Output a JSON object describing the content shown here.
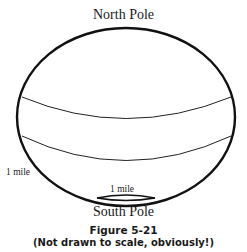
{
  "diagram": {
    "labels": {
      "north_pole": "North Pole",
      "south_pole": "South Pole",
      "distance_left": "1 mile",
      "distance_bottom": "1 mile"
    },
    "figure": {
      "number": "Figure 5-21",
      "caption": "(Not drawn to scale, obviously!)"
    },
    "shapes": {
      "globe": "ellipse",
      "latitude_lines": 2,
      "south_pole_circle": "small circle near south pole"
    },
    "colors": {
      "line": "#111111",
      "background": "#ffffff"
    }
  }
}
